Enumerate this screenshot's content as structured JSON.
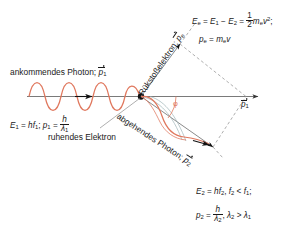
{
  "diagram": {
    "colors": {
      "wave": "#e0785e",
      "axis": "#6b6b6b",
      "dashed": "#9a9a9a",
      "text": "#1a1a1a",
      "angle": "#e0785e",
      "electron_dot": "#111111",
      "outgoing_guide": "#8fa8ac"
    },
    "labels": {
      "incoming_photon": "ankommendes Photon; ",
      "incoming_photon_sym": "p",
      "incoming_photon_sub": "1",
      "recoil_electron": "Rückfckstoßelektron; ",
      "recoil_electron_text": "Rükstoßelektron; ",
      "recoil_electron_sym": "p",
      "recoil_electron_sub": "e",
      "outgoing_photon_text": "abgehendes Photon; ",
      "outgoing_photon_sym": "p",
      "outgoing_photon_sub": "2",
      "resting_electron": "ruhendes Elektron",
      "axis_label_sym": "p",
      "axis_label_sub": "1",
      "angle_symbol": "φ"
    },
    "formulas": {
      "incoming": {
        "e_lhs": "E",
        "e_sub": "1",
        "eq": " = ",
        "hf": "hf",
        "hf_sub": "1",
        "semi": "; ",
        "p_lhs": "p",
        "p_sub": "1",
        "eq2": " = ",
        "frac_num": "h",
        "frac_den_sym": "λ",
        "frac_den_sub": "1"
      },
      "electron": {
        "line1_a": "E",
        "line1_a_sub": "e",
        "line1_eq": " = ",
        "line1_b": "E",
        "line1_b_sub": "1",
        "line1_minus": " − ",
        "line1_c": "E",
        "line1_c_sub": "2",
        "line1_eq2": " = ",
        "frac_num": "1",
        "frac_den": "2",
        "line1_m": "m",
        "line1_m_sub": "e",
        "line1_v": "v",
        "line1_v_sup": "2",
        "line1_end": ";",
        "line2_p": "p",
        "line2_p_sub": "e",
        "line2_eq": " = ",
        "line2_m": "m",
        "line2_m_sub": "e",
        "line2_v": "v"
      },
      "outgoing": {
        "l1_e": "E",
        "l1_e_sub": "2",
        "l1_eq": " = ",
        "l1_hf": "hf",
        "l1_hf_sub": "2",
        "l1_comma": ", ",
        "l1_f": "f",
        "l1_f_sub": "2",
        "l1_lt": " < ",
        "l1_f2": "f",
        "l1_f2_sub": "1",
        "l1_end": ";",
        "l2_p": "p",
        "l2_p_sub": "2",
        "l2_eq": " = ",
        "l2_frac_num": "h",
        "l2_frac_den_sym": "λ",
        "l2_frac_den_sub": "2",
        "l2_comma": ", ",
        "l2_lam": "λ",
        "l2_lam_sub": "2",
        "l2_gt": " > ",
        "l2_lam2": "λ",
        "l2_lam2_sub": "1"
      }
    }
  }
}
